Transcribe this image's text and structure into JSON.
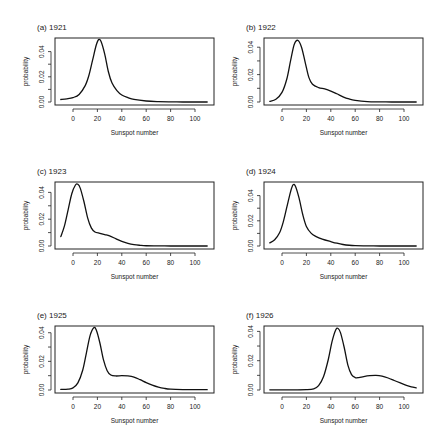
{
  "chart_data": [
    {
      "type": "line",
      "panel": "a",
      "title": "(a) 1921",
      "xlabel": "Sunspot number",
      "ylabel": "probability",
      "xlim": [
        -10,
        110
      ],
      "ylim": [
        0,
        0.05
      ],
      "xticks": [
        0,
        20,
        40,
        60,
        80,
        100
      ],
      "yticks": [
        "0.00",
        "0.02",
        "0.04"
      ],
      "x": [
        -10,
        -5,
        0,
        5,
        10,
        13,
        16,
        19,
        21,
        23,
        26,
        29,
        32,
        36,
        40,
        45,
        50,
        60,
        70,
        80,
        90,
        100,
        110
      ],
      "y": [
        0.002,
        0.0025,
        0.0035,
        0.006,
        0.013,
        0.021,
        0.033,
        0.045,
        0.0495,
        0.048,
        0.038,
        0.024,
        0.015,
        0.009,
        0.0055,
        0.0035,
        0.002,
        0.0008,
        0.0003,
        0.0001,
        0.0,
        0.0,
        0.0
      ]
    },
    {
      "type": "line",
      "panel": "b",
      "title": "(b) 1922",
      "xlabel": "Sunspot number",
      "ylabel": "probability",
      "xlim": [
        -10,
        110
      ],
      "ylim": [
        0,
        0.046
      ],
      "xticks": [
        0,
        20,
        40,
        60,
        80,
        100
      ],
      "yticks": [
        "0.00",
        "0.02",
        "0.04"
      ],
      "x": [
        -10,
        -5,
        0,
        4,
        7,
        10,
        13,
        16,
        19,
        22,
        25,
        30,
        35,
        40,
        45,
        50,
        55,
        60,
        70,
        80,
        90,
        100,
        110
      ],
      "y": [
        0.0005,
        0.002,
        0.007,
        0.017,
        0.03,
        0.042,
        0.045,
        0.04,
        0.029,
        0.018,
        0.013,
        0.0105,
        0.0095,
        0.008,
        0.006,
        0.0038,
        0.0022,
        0.0012,
        0.0003,
        0.0001,
        0.0,
        0.0,
        0.0
      ]
    },
    {
      "type": "line",
      "panel": "c",
      "title": "(c) 1923",
      "xlabel": "Sunspot number",
      "ylabel": "probability",
      "xlim": [
        -10,
        110
      ],
      "ylim": [
        0,
        0.047
      ],
      "xticks": [
        0,
        20,
        40,
        60,
        80,
        100
      ],
      "yticks": [
        "0.00",
        "0.02",
        "0.04"
      ],
      "x": [
        -10,
        -7,
        -4,
        -1,
        2,
        4,
        6,
        9,
        12,
        15,
        18,
        22,
        26,
        30,
        35,
        40,
        45,
        50,
        55,
        60,
        70,
        80,
        90,
        100,
        110
      ],
      "y": [
        0.007,
        0.015,
        0.027,
        0.039,
        0.0455,
        0.046,
        0.043,
        0.033,
        0.021,
        0.0135,
        0.0105,
        0.0095,
        0.0085,
        0.0075,
        0.0055,
        0.0035,
        0.002,
        0.001,
        0.0005,
        0.0002,
        0.0001,
        0.0,
        0.0,
        0.0,
        0.0
      ]
    },
    {
      "type": "line",
      "panel": "d",
      "title": "(d) 1924",
      "xlabel": "Sunspot number",
      "ylabel": "probability",
      "xlim": [
        -10,
        110
      ],
      "ylim": [
        0,
        0.05
      ],
      "xticks": [
        0,
        20,
        40,
        60,
        80,
        100
      ],
      "yticks": [
        "0.00",
        "0.02",
        "0.04"
      ],
      "x": [
        -10,
        -6,
        -2,
        1,
        4,
        7,
        9,
        11,
        14,
        17,
        20,
        24,
        28,
        33,
        40,
        45,
        50,
        55,
        60,
        70,
        80,
        90,
        100,
        110
      ],
      "y": [
        0.0025,
        0.005,
        0.0105,
        0.019,
        0.031,
        0.043,
        0.0485,
        0.0475,
        0.038,
        0.025,
        0.0155,
        0.01,
        0.0075,
        0.0055,
        0.0035,
        0.0022,
        0.0012,
        0.0006,
        0.0003,
        0.0001,
        0.0,
        0.0,
        0.0,
        0.0
      ]
    },
    {
      "type": "line",
      "panel": "e",
      "title": "(e) 1925",
      "xlabel": "Sunspot number",
      "ylabel": "probability",
      "xlim": [
        -10,
        110
      ],
      "ylim": [
        0,
        0.044
      ],
      "xticks": [
        0,
        20,
        40,
        60,
        80,
        100
      ],
      "yticks": [
        "0.00",
        "0.02",
        "0.04"
      ],
      "x": [
        -10,
        -4,
        0,
        4,
        8,
        11,
        14,
        17,
        19,
        22,
        25,
        28,
        31,
        35,
        40,
        45,
        50,
        55,
        60,
        65,
        70,
        75,
        80,
        90,
        100,
        110
      ],
      "y": [
        0.0004,
        0.0006,
        0.0015,
        0.005,
        0.014,
        0.026,
        0.038,
        0.0435,
        0.042,
        0.033,
        0.021,
        0.0135,
        0.0105,
        0.0098,
        0.01,
        0.0098,
        0.009,
        0.0072,
        0.0052,
        0.0034,
        0.002,
        0.0011,
        0.0006,
        0.0003,
        0.0002,
        0.0002
      ]
    },
    {
      "type": "line",
      "panel": "f",
      "title": "(f) 1926",
      "xlabel": "Sunspot number",
      "ylabel": "probability",
      "xlim": [
        -10,
        110
      ],
      "ylim": [
        0,
        0.043
      ],
      "xticks": [
        0,
        20,
        40,
        60,
        80,
        100
      ],
      "yticks": [
        "0.00",
        "0.02",
        "0.04"
      ],
      "x": [
        -10,
        0,
        10,
        20,
        26,
        30,
        34,
        38,
        41,
        44,
        46,
        48,
        51,
        54,
        57,
        60,
        63,
        67,
        72,
        77,
        82,
        87,
        92,
        97,
        102,
        106,
        110
      ],
      "y": [
        0.0001,
        0.0001,
        0.0001,
        0.0002,
        0.0008,
        0.003,
        0.009,
        0.021,
        0.033,
        0.041,
        0.042,
        0.039,
        0.029,
        0.017,
        0.0105,
        0.0085,
        0.0085,
        0.0092,
        0.0098,
        0.01,
        0.0095,
        0.0082,
        0.0065,
        0.0048,
        0.0032,
        0.0022,
        0.0015
      ]
    }
  ],
  "layout": {
    "columns": [
      55,
      264
    ],
    "rows": [
      38,
      182,
      326
    ],
    "frame_width": 159,
    "frame_height": 67,
    "x_origin_offset": 18,
    "px_per_unit": 1.22
  }
}
